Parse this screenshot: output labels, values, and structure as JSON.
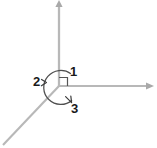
{
  "figure": {
    "background_color": "#ffffff",
    "width": 157,
    "height": 148
  },
  "colors": {
    "axis": "#b4b4b4",
    "axis_dark": "#a8a8a8",
    "arc": "#4f4f4f",
    "label": "#1a1a1a",
    "right_angle_marker": "#555555"
  },
  "origin": {
    "x": 59,
    "y": 86
  },
  "rays": [
    {
      "name": "vertical-axis",
      "direction": "up",
      "arrowhead": true,
      "from": {
        "x": 59,
        "y": 86
      },
      "to": {
        "x": 59,
        "y": 3
      }
    },
    {
      "name": "horizontal-axis",
      "direction": "right",
      "arrowhead": true,
      "from": {
        "x": 59,
        "y": 86
      },
      "to": {
        "x": 152,
        "y": 86
      }
    },
    {
      "name": "diagonal-axis",
      "direction": "down-left",
      "arrowhead": false,
      "from": {
        "x": 59,
        "y": 86
      },
      "to": {
        "x": 3,
        "y": 145
      }
    }
  ],
  "arc": {
    "name": "angle-arc",
    "center": {
      "x": 59,
      "y": 86
    },
    "radius": 17,
    "note": "near-complete circle traced around the origin spanning the three angles"
  },
  "right_angle_marker": {
    "name": "right-angle-square",
    "between": [
      "vertical-axis",
      "horizontal-axis"
    ],
    "size": 8
  },
  "labels": [
    {
      "id": "label-1",
      "text": "1",
      "x": 73,
      "y": 74,
      "describes": "angle between vertical axis (up) and horizontal axis (right)",
      "has_leader": false
    },
    {
      "id": "label-2",
      "text": "2",
      "x": 36,
      "y": 83,
      "describes": "angle between diagonal axis (down-left) and vertical axis (up)",
      "has_leader": true
    },
    {
      "id": "label-3",
      "text": "3",
      "x": 74,
      "y": 111,
      "describes": "angle between horizontal axis (right) and diagonal axis (down-left)",
      "has_leader": true
    }
  ]
}
